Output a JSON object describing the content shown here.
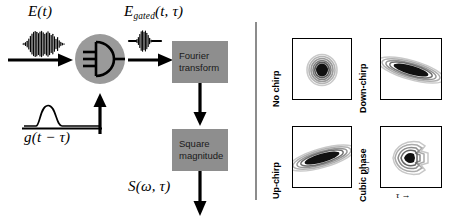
{
  "figure": {
    "left_panel": {
      "input_field_label": "E(t)",
      "input_field_label_parts": {
        "symbol": "E",
        "arg": "(t)"
      },
      "gated_field_label_parts": {
        "symbol": "E",
        "subscript": "gated",
        "arg": "(t, τ)"
      },
      "gate_function_label_parts": {
        "symbol": "g",
        "arg": "(t − τ)"
      },
      "output_label_parts": {
        "symbol": "S",
        "arg": "(ω, τ)"
      },
      "gate_icon": "optical-gate-icon",
      "pulse_icon": "oscillating-pulse-icon",
      "gate_pulse_icon": "flat-top-pulse-icon",
      "boxes": [
        {
          "line1": "Fourier",
          "line2": "transform"
        },
        {
          "line1": "Square",
          "line2": "magnitude"
        }
      ],
      "arrows": [
        "input-beam-arrow",
        "gate-beam-arrow",
        "gated-beam-arrow",
        "fourier-to-square-arrow",
        "output-arrow"
      ]
    },
    "right_panel": {
      "x_axis_label": "τ →",
      "y_axis_label": "ω ↑",
      "plots": [
        {
          "label": "No chirp",
          "shape": "round",
          "tilt_deg": 0,
          "name": "spectrogram-no-chirp"
        },
        {
          "label": "Down-chirp",
          "shape": "ellipse",
          "tilt_deg": 16,
          "name": "spectrogram-down-chirp"
        },
        {
          "label": "Up-chirp",
          "shape": "ellipse",
          "tilt_deg": -16,
          "name": "spectrogram-up-chirp"
        },
        {
          "label": "Cubic phase",
          "shape": "forked",
          "tilt_deg": 0,
          "name": "spectrogram-cubic-phase"
        }
      ]
    },
    "colors": {
      "box_gray": "#8e8e8e",
      "divider_gray": "#8c8c8c",
      "ink": "#000000",
      "contour_dark": "#111111",
      "contour_mid": "#666666",
      "contour_light": "#aaaaaa"
    }
  }
}
